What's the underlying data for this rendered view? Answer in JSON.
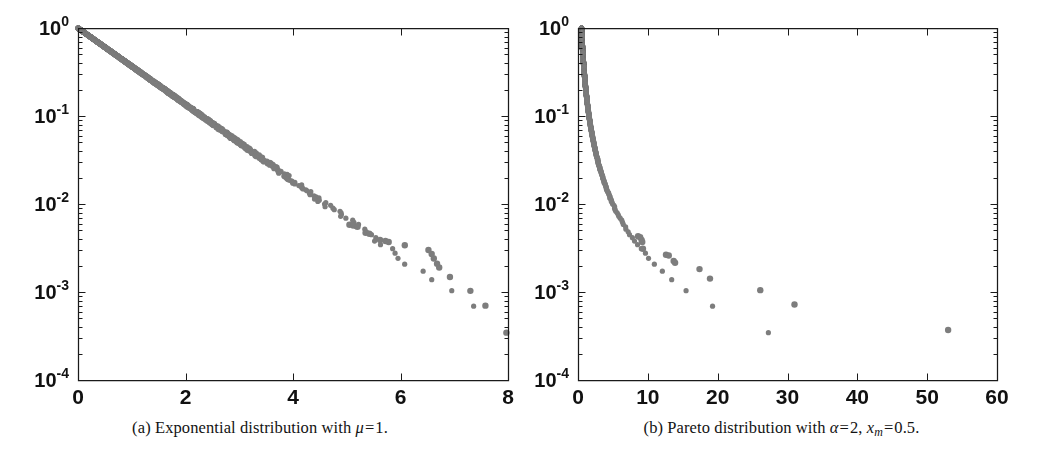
{
  "figure": {
    "background": "#ffffff",
    "marker_color": "#7d7d7d",
    "axis_color": "#1a1a1a",
    "tick_label_color": "#111111",
    "width": 1043,
    "height": 463
  },
  "panels": [
    {
      "id": "a",
      "caption_prefix": "(a)",
      "caption_text": "Exponential distribution with",
      "caption_symbol": "μ",
      "caption_eq": "=",
      "caption_value": "1.",
      "caption_full": "(a) Exponential distribution with μ = 1."
    },
    {
      "id": "b",
      "caption_prefix": "(b)",
      "caption_text": "Pareto distribution with",
      "caption_symbol": "α",
      "caption_eq": "=",
      "caption_value": "2,",
      "caption_symbol2": "x",
      "caption_symbol2_sub": "m",
      "caption_eq2": "=",
      "caption_value2": "0.5.",
      "caption_full": "(b) Pareto distribution with α = 2, x_m = 0.5."
    }
  ],
  "chart_data": [
    {
      "type": "scatter",
      "panel": "a",
      "title": "",
      "xlabel": "",
      "ylabel": "",
      "xlim": [
        0,
        8
      ],
      "ylim": [
        0.0001,
        1
      ],
      "yscale": "log",
      "xscale": "linear",
      "grid": false,
      "legend": null,
      "xticks": [
        0,
        2,
        4,
        6,
        8
      ],
      "xticklabels": [
        "0",
        "2",
        "4",
        "6",
        "8"
      ],
      "yticks": [
        1,
        0.1,
        0.01,
        0.001,
        0.0001
      ],
      "yticklabels": [
        "10^0",
        "10^-1",
        "10^-2",
        "10^-3",
        "10^-4"
      ],
      "minor_ticks": true,
      "box_frame": true,
      "marker": "circle",
      "marker_size": 5.2,
      "description": "Empirical complementary CDF of exponential samples, mu=1, plotted on semilog-y; straight decaying line from (0,1) to about (7.7, 4e-4)",
      "series": [
        {
          "name": "empirical CCDF",
          "distribution": "exponential",
          "mu": 1,
          "n_points": 2900,
          "x": [
            0,
            8
          ],
          "y": [
            1,
            0.000335
          ]
        }
      ],
      "tail_points": [
        {
          "x": 5.05,
          "y": 0.0058
        },
        {
          "x": 5.12,
          "y": 0.0057
        },
        {
          "x": 5.2,
          "y": 0.0055
        },
        {
          "x": 5.35,
          "y": 0.0047
        },
        {
          "x": 5.42,
          "y": 0.0046
        },
        {
          "x": 5.62,
          "y": 0.0039
        },
        {
          "x": 5.72,
          "y": 0.0038
        },
        {
          "x": 5.78,
          "y": 0.0037
        },
        {
          "x": 6.08,
          "y": 0.0034
        },
        {
          "x": 6.52,
          "y": 0.003
        },
        {
          "x": 6.58,
          "y": 0.0027
        },
        {
          "x": 6.62,
          "y": 0.0024
        },
        {
          "x": 6.68,
          "y": 0.0021
        },
        {
          "x": 6.72,
          "y": 0.0019
        },
        {
          "x": 6.92,
          "y": 0.00148
        },
        {
          "x": 7.3,
          "y": 0.00103
        },
        {
          "x": 7.58,
          "y": 0.0007
        },
        {
          "x": 7.97,
          "y": 0.000345
        }
      ]
    },
    {
      "type": "scatter",
      "panel": "b",
      "title": "",
      "xlabel": "",
      "ylabel": "",
      "xlim": [
        0,
        60
      ],
      "ylim": [
        0.0001,
        1
      ],
      "yscale": "log",
      "xscale": "linear",
      "grid": false,
      "legend": null,
      "xticks": [
        0,
        10,
        20,
        30,
        40,
        50,
        60
      ],
      "xticklabels": [
        "0",
        "10",
        "20",
        "30",
        "40",
        "50",
        "60"
      ],
      "yticks": [
        1,
        0.1,
        0.01,
        0.001,
        0.0001
      ],
      "yticklabels": [
        "10^0",
        "10^-1",
        "10^-2",
        "10^-3",
        "10^-4"
      ],
      "minor_ticks": true,
      "box_frame": true,
      "marker": "circle",
      "marker_size": 5.2,
      "description": "Empirical complementary CDF of Pareto samples, alpha=2, xm=0.5, semilog-y; sharp convex decay hugging left axis with isolated tail points out to x=53",
      "series": [
        {
          "name": "empirical CCDF",
          "distribution": "pareto",
          "alpha": 2,
          "xm": 0.5,
          "n_points": 2900,
          "x": [
            0.5,
            60
          ],
          "y": [
            1,
            0.000345
          ]
        }
      ],
      "tail_points": [
        {
          "x": 8.6,
          "y": 0.0043
        },
        {
          "x": 8.9,
          "y": 0.0042
        },
        {
          "x": 9.1,
          "y": 0.0039
        },
        {
          "x": 9.2,
          "y": 0.0037
        },
        {
          "x": 9.3,
          "y": 0.0031
        },
        {
          "x": 12.6,
          "y": 0.00265
        },
        {
          "x": 13.0,
          "y": 0.0026
        },
        {
          "x": 13.7,
          "y": 0.00225
        },
        {
          "x": 13.9,
          "y": 0.00215
        },
        {
          "x": 17.4,
          "y": 0.00182
        },
        {
          "x": 18.9,
          "y": 0.00142
        },
        {
          "x": 26.1,
          "y": 0.00105
        },
        {
          "x": 31.0,
          "y": 0.00072
        },
        {
          "x": 53.0,
          "y": 0.00037
        }
      ]
    }
  ]
}
